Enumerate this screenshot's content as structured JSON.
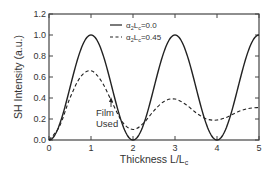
{
  "chart_data": {
    "type": "line",
    "title": "",
    "xlabel": "Thickness  L/L",
    "xlabel_sub": "c",
    "ylabel": "SH  Intensity  (a.u.)",
    "xlim": [
      0,
      5
    ],
    "ylim": [
      0,
      1.2
    ],
    "xticks": [
      "0",
      "1",
      "2",
      "3",
      "4",
      "5"
    ],
    "yticks": [
      "0.0",
      "0.2",
      "0.4",
      "0.6",
      "0.8",
      "1.0",
      "1.2"
    ],
    "grid": false,
    "legend_position": "upper-left-center",
    "series": [
      {
        "name": "α2Lc=0.0",
        "legend_main": "α",
        "legend_sub1": "2",
        "legend_mid": "L",
        "legend_sub2": "c",
        "legend_val": "=0.0",
        "style": "solid",
        "x": [
          0,
          0.25,
          0.5,
          0.75,
          1.0,
          1.25,
          1.5,
          1.75,
          2.0,
          2.25,
          2.5,
          2.75,
          3.0,
          3.25,
          3.5,
          3.75,
          4.0,
          4.25,
          4.5,
          4.75,
          5.0
        ],
        "values": [
          0.0,
          0.15,
          0.5,
          0.85,
          1.0,
          0.85,
          0.5,
          0.15,
          0.0,
          0.15,
          0.5,
          0.85,
          1.0,
          0.85,
          0.5,
          0.15,
          0.0,
          0.15,
          0.5,
          0.85,
          1.0
        ]
      },
      {
        "name": "α2Lc=0.45",
        "legend_main": "α",
        "legend_sub1": "2",
        "legend_mid": "L",
        "legend_sub2": "c",
        "legend_val": "=0.45",
        "style": "dashed",
        "x": [
          0,
          0.25,
          0.5,
          0.75,
          1.0,
          1.25,
          1.5,
          1.75,
          2.0,
          2.25,
          2.5,
          2.75,
          3.0,
          3.25,
          3.5,
          3.75,
          4.0,
          4.25,
          4.5,
          4.75,
          5.0
        ],
        "values": [
          0.0,
          0.13,
          0.4,
          0.6,
          0.66,
          0.56,
          0.36,
          0.17,
          0.1,
          0.16,
          0.28,
          0.37,
          0.39,
          0.34,
          0.26,
          0.2,
          0.19,
          0.22,
          0.27,
          0.3,
          0.31
        ]
      }
    ],
    "annotations": [
      {
        "text_line1": "Film",
        "text_line2": "Used",
        "x": 1.5,
        "y": 0.3,
        "arrow": "up"
      }
    ]
  }
}
